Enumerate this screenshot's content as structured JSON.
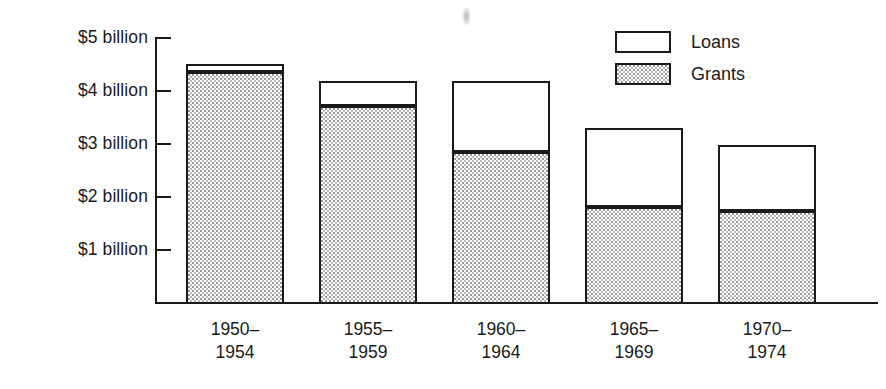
{
  "chart_data": {
    "type": "bar",
    "stacked": true,
    "title": "",
    "subtitle": "",
    "xlabel": "",
    "ylabel": "",
    "grid": false,
    "legend_position": "top-right",
    "categories": [
      "1950–1954",
      "1955–1959",
      "1960–1964",
      "1965–1969",
      "1970–1974"
    ],
    "category_lines": [
      [
        "1950–",
        "1954"
      ],
      [
        "1955–",
        "1959"
      ],
      [
        "1960–",
        "1964"
      ],
      [
        "1965–",
        "1969"
      ],
      [
        "1970–",
        "1974"
      ]
    ],
    "series": [
      {
        "name": "Grants",
        "values": [
          4.36,
          3.72,
          2.85,
          1.81,
          1.74
        ]
      },
      {
        "name": "Loans",
        "values": [
          0.15,
          0.47,
          1.34,
          1.49,
          1.24
        ]
      }
    ],
    "totals": [
      4.51,
      4.19,
      4.19,
      3.3,
      2.98
    ],
    "ylim": [
      0,
      5
    ],
    "yticks": [
      1,
      2,
      3,
      4,
      5
    ],
    "ytick_labels": [
      "$1 billion",
      "$2 billion",
      "$3 billion",
      "$4 billion",
      "$5 billion"
    ],
    "units": "billions of dollars"
  },
  "legend": {
    "items": [
      {
        "label": "Loans",
        "fill": "white"
      },
      {
        "label": "Grants",
        "fill": "stipple"
      }
    ]
  },
  "colors": {
    "ink": "#1a1a1a",
    "background": "#ffffff",
    "stipple": "#9a9a9a"
  }
}
